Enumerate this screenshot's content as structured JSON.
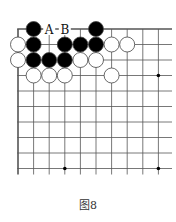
{
  "diagram": {
    "caption": "图8",
    "board": {
      "cols": 10,
      "rows": 10,
      "origin_x": 18,
      "origin_y": 29,
      "spacing_x": 15.6,
      "spacing_y": 15.5,
      "edges": [
        "left",
        "top"
      ],
      "star_points": [
        [
          9,
          3
        ],
        [
          3,
          9
        ],
        [
          9,
          9
        ]
      ],
      "stones": [
        {
          "col": 1,
          "row": 0,
          "color": "black"
        },
        {
          "col": 5,
          "row": 0,
          "color": "black"
        },
        {
          "col": 0,
          "row": 1,
          "color": "white"
        },
        {
          "col": 1,
          "row": 1,
          "color": "black"
        },
        {
          "col": 3,
          "row": 1,
          "color": "black"
        },
        {
          "col": 4,
          "row": 1,
          "color": "black"
        },
        {
          "col": 5,
          "row": 1,
          "color": "black"
        },
        {
          "col": 6,
          "row": 1,
          "color": "white"
        },
        {
          "col": 7,
          "row": 1,
          "color": "white"
        },
        {
          "col": 0,
          "row": 2,
          "color": "white"
        },
        {
          "col": 1,
          "row": 2,
          "color": "black"
        },
        {
          "col": 2,
          "row": 2,
          "color": "black"
        },
        {
          "col": 3,
          "row": 2,
          "color": "black"
        },
        {
          "col": 4,
          "row": 2,
          "color": "white"
        },
        {
          "col": 5,
          "row": 2,
          "color": "white"
        },
        {
          "col": 1,
          "row": 3,
          "color": "white"
        },
        {
          "col": 2,
          "row": 3,
          "color": "white"
        },
        {
          "col": 3,
          "row": 3,
          "color": "white"
        },
        {
          "col": 6,
          "row": 3,
          "color": "white"
        }
      ],
      "labels": [
        {
          "col": 2,
          "row": 0,
          "text": "A"
        },
        {
          "col": 3,
          "row": 0,
          "text": "B"
        }
      ]
    },
    "colors": {
      "line": "#555555",
      "black_stone": "#000000",
      "white_stone": "#ffffff",
      "stone_outline": "#444444"
    }
  }
}
